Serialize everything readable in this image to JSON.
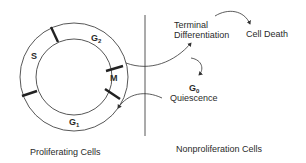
{
  "diagram": {
    "cycle_phases": [
      {
        "id": "S",
        "label": "S",
        "sub": ""
      },
      {
        "id": "G2",
        "label": "G",
        "sub": "2"
      },
      {
        "id": "M",
        "label": "M",
        "sub": ""
      },
      {
        "id": "G1",
        "label": "G",
        "sub": "1"
      }
    ],
    "fates": {
      "terminal_differentiation": {
        "line1": "Terminal",
        "line2": "Differentiation"
      },
      "cell_death": "Cell Death",
      "g0": {
        "label": "G",
        "sub": "0",
        "caption": "Quiescence"
      }
    },
    "sections": {
      "left": "Proliferating Cells",
      "right": "Nonproliferation Cells"
    },
    "colors": {
      "line": "#333333",
      "background": "#ffffff"
    }
  }
}
